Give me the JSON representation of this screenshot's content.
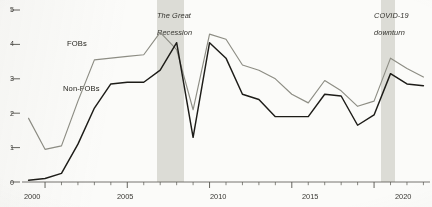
{
  "chart_data": {
    "type": "line",
    "title": "",
    "subtitle": "",
    "xlabel": "",
    "ylabel": "",
    "xlim": [
      1998.6,
      2023.4
    ],
    "ylim": [
      0,
      5.35
    ],
    "grid": false,
    "legend_position": "inline-annotation",
    "x_ticks_major": [
      2000,
      2005,
      2010,
      2015,
      2020
    ],
    "x_tick_labels": [
      "2000",
      "2005",
      "2010",
      "2015",
      "2020"
    ],
    "x_ticks_minor_step": 1,
    "y_ticks": [
      0,
      1,
      2,
      3,
      4,
      5
    ],
    "y_tick_labels": [
      "0",
      "1",
      "2",
      "3",
      "4",
      "5"
    ],
    "x": [
      1999,
      2000,
      2001,
      2002,
      2003,
      2004,
      2005,
      2006,
      2007,
      2008,
      2009,
      2010,
      2011,
      2012,
      2013,
      2014,
      2015,
      2016,
      2017,
      2018,
      2019,
      2020,
      2021,
      2022,
      2023
    ],
    "series": [
      {
        "name": "FOBs",
        "color": "#8d8d84",
        "values": [
          1.85,
          0.95,
          1.05,
          2.35,
          3.55,
          3.6,
          3.65,
          3.7,
          4.35,
          3.85,
          2.1,
          4.3,
          4.15,
          3.4,
          3.25,
          3.0,
          2.55,
          2.3,
          2.95,
          2.65,
          2.2,
          2.35,
          3.6,
          3.3,
          3.05
        ]
      },
      {
        "name": "Non-FOBs",
        "color": "#1d1c18",
        "values": [
          0.05,
          0.1,
          0.25,
          1.1,
          2.15,
          2.85,
          2.9,
          2.9,
          3.25,
          4.05,
          1.3,
          4.05,
          3.6,
          2.55,
          2.4,
          1.9,
          1.9,
          1.9,
          2.55,
          2.5,
          1.65,
          1.95,
          3.15,
          2.85,
          2.8
        ]
      }
    ],
    "bands": [
      {
        "name": "The Great Recession",
        "label": "The Great Recession",
        "x_start": 2007.2,
        "x_end": 2008.85,
        "color": "#d9d9d2"
      },
      {
        "name": "COVID-19 downturn",
        "label": "COVID-19 downturn",
        "x_start": 2020.0,
        "x_end": 2020.85,
        "color": "#d9d9d2"
      }
    ],
    "series_labels": [
      {
        "name": "FOBs",
        "text": "FOBs"
      },
      {
        "name": "Non-FOBs",
        "text": "Non-FOBs"
      }
    ]
  },
  "annotations": {
    "great_recession_line1": "The Great",
    "great_recession_line2": "Recession",
    "covid_line1": "COVID-19",
    "covid_line2": "downturn"
  },
  "axis": {
    "y0": "0",
    "y1": "1",
    "y2": "2",
    "y3": "3",
    "y4": "4",
    "y5": "5",
    "x2000": "2000",
    "x2005": "2005",
    "x2010": "2010",
    "x2015": "2015",
    "x2020": "2020"
  },
  "labels": {
    "fobs": "FOBs",
    "non_fobs": "Non-FOBs"
  }
}
